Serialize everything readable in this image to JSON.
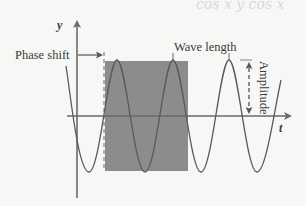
{
  "diagram": {
    "axes": {
      "y_label": "y",
      "x_label": "t"
    },
    "annotations": {
      "phase_shift": "Phase shift",
      "wave_length": "Wave length",
      "amplitude": "Amplitude"
    },
    "faint_handwriting": "cos x   y cos x",
    "colors": {
      "background": "#f7f7f5",
      "line": "#6a6a6a",
      "shaded_region": "#8c8c8c",
      "text": "#3a3a3a"
    }
  }
}
